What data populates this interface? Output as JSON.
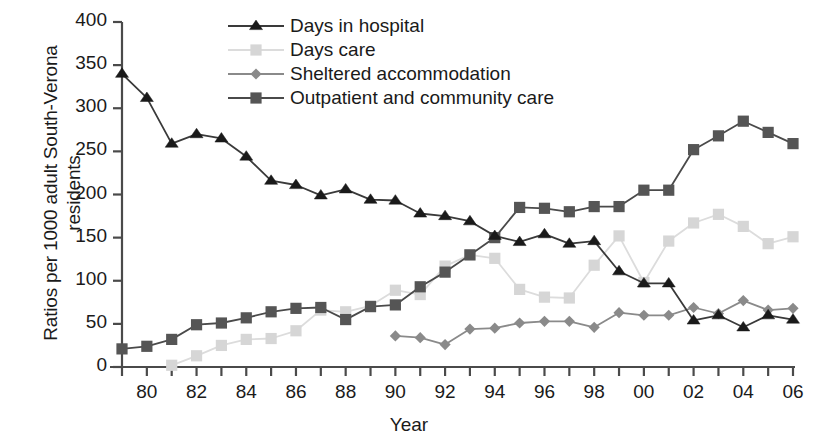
{
  "chart_data": {
    "type": "line",
    "title": "",
    "xlabel": "Year",
    "ylabel": "Ratios per 1000 adult South-Verona\nresidents",
    "ylim": [
      0,
      400
    ],
    "yticks": [
      0,
      50,
      100,
      150,
      200,
      250,
      300,
      350,
      400
    ],
    "xlim": [
      1979,
      2006
    ],
    "xticks": [
      1980,
      1982,
      1984,
      1986,
      1988,
      1990,
      1992,
      1994,
      1996,
      1998,
      2000,
      2002,
      2004,
      2006
    ],
    "xtick_labels": [
      "80",
      "82",
      "84",
      "86",
      "88",
      "90",
      "92",
      "94",
      "96",
      "98",
      "00",
      "02",
      "04",
      "06"
    ],
    "x_all": [
      1979,
      1980,
      1981,
      1982,
      1983,
      1984,
      1985,
      1986,
      1987,
      1988,
      1989,
      1990,
      1991,
      1992,
      1993,
      1994,
      1995,
      1996,
      1997,
      1998,
      1999,
      2000,
      2001,
      2002,
      2003,
      2004,
      2005,
      2006
    ],
    "grid": false,
    "legend_position": "top-center",
    "series": [
      {
        "name": "Days in hospital",
        "marker": "triangle",
        "color": "#1a1a1a",
        "line_color": "#3a3a3a",
        "x": [
          1979,
          1980,
          1981,
          1982,
          1983,
          1984,
          1985,
          1986,
          1987,
          1988,
          1989,
          1990,
          1991,
          1992,
          1993,
          1994,
          1995,
          1996,
          1997,
          1998,
          1999,
          2000,
          2001,
          2002,
          2003,
          2004,
          2005,
          2006
        ],
        "values": [
          340,
          312,
          259,
          270,
          265,
          244,
          216,
          211,
          199,
          206,
          194,
          193,
          178,
          175,
          169,
          152,
          145,
          154,
          143,
          146,
          111,
          97,
          97,
          54,
          60,
          46,
          60,
          55
        ]
      },
      {
        "name": "Days care",
        "marker": "square",
        "color": "#d6d6d6",
        "line_color": "#dcdcdc",
        "x": [
          1981,
          1982,
          1983,
          1984,
          1985,
          1986,
          1987,
          1988,
          1989,
          1990,
          1991,
          1992,
          1993,
          1994,
          1995,
          1996,
          1997,
          1998,
          1999,
          2000,
          2001,
          2002,
          2003,
          2004,
          2005,
          2006
        ],
        "values": [
          2,
          13,
          25,
          32,
          33,
          42,
          66,
          64,
          71,
          89,
          84,
          117,
          130,
          126,
          90,
          81,
          80,
          118,
          152,
          98,
          146,
          167,
          177,
          163,
          143,
          151
        ]
      },
      {
        "name": "Sheltered accommodation",
        "marker": "diamond",
        "color": "#8a8a8a",
        "line_color": "#8a8a8a",
        "x": [
          1990,
          1991,
          1992,
          1993,
          1994,
          1995,
          1996,
          1997,
          1998,
          1999,
          2000,
          2001,
          2002,
          2003,
          2004,
          2005,
          2006
        ],
        "values": [
          36,
          34,
          26,
          44,
          45,
          51,
          53,
          53,
          46,
          63,
          60,
          60,
          69,
          62,
          77,
          66,
          68
        ]
      },
      {
        "name": "Outpatient and community care",
        "marker": "square",
        "color": "#555555",
        "line_color": "#4a4a4a",
        "x": [
          1979,
          1980,
          1981,
          1982,
          1983,
          1984,
          1985,
          1986,
          1987,
          1988,
          1989,
          1990,
          1991,
          1992,
          1993,
          1994,
          1995,
          1996,
          1997,
          1998,
          1999,
          2000,
          2001,
          2002,
          2003,
          2004,
          2005,
          2006
        ],
        "values": [
          21,
          24,
          32,
          49,
          51,
          57,
          64,
          68,
          69,
          55,
          70,
          72,
          93,
          110,
          130,
          150,
          185,
          184,
          180,
          186,
          186,
          205,
          205,
          252,
          268,
          285,
          272,
          259
        ]
      }
    ]
  },
  "legend": {
    "items": [
      {
        "label": "Days in hospital"
      },
      {
        "label": "Days care"
      },
      {
        "label": "Sheltered accommodation"
      },
      {
        "label": "Outpatient and community care"
      }
    ]
  },
  "axes": {
    "x_title": "Year",
    "y_title_line1": "Ratios per 1000 adult South-Verona",
    "y_title_line2": "residents"
  }
}
